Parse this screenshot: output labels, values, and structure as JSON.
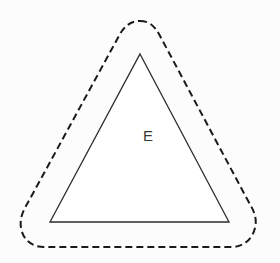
{
  "figure": {
    "background_color": "#fcfcfc",
    "canvas": {
      "width": 280,
      "height": 263
    },
    "shapes": {
      "triangle": {
        "name": "solid-triangle",
        "label": "E",
        "stroke_color": "#2b2b2b",
        "stroke_width": 1.3,
        "fill_color": "#ffffff",
        "vertices": [
          {
            "x": 140,
            "y": 54
          },
          {
            "x": 229,
            "y": 222
          },
          {
            "x": 50,
            "y": 222
          }
        ],
        "points_attr": "140,54 229,222 50,222"
      },
      "dashed_outline": {
        "name": "dashed-offset-boundary",
        "stroke_color": "#1a1a1a",
        "stroke_width": 2,
        "fill_color": "none",
        "dash_pattern": "7,4",
        "path_d": "M 140 21 C 150 21 155 27 159 34 L 246 197 C 252 208 258 216 255 228 C 252 240 243 247 231 247 L 44 247 C 32 247 23 240 21 228 C 19 216 25 208 31 197 L 120 34 C 124 27 130 21 140 21 Z"
      }
    },
    "labels": [
      {
        "name": "region-label-e",
        "text": "E",
        "x": 143,
        "y": 128,
        "color": "#3a3a3a",
        "font_size": 15
      }
    ]
  }
}
